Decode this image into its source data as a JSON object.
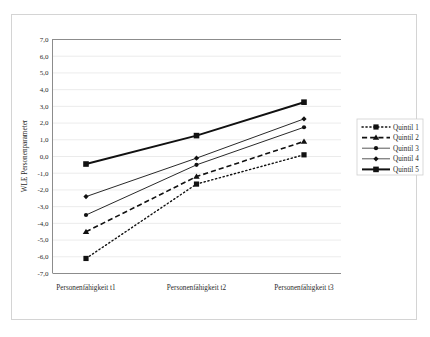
{
  "chart_data": {
    "type": "line",
    "title": "",
    "xlabel": "",
    "ylabel": "WLE Personenparameter",
    "categories": [
      "Personenfähigkeit t1",
      "Personenfähigkeit t2",
      "Personenfähigkeit t3"
    ],
    "ylim": [
      -7.0,
      7.0
    ],
    "ytick_step": 1.0,
    "ytick_labels": [
      "7,0",
      "6,0",
      "5,0",
      "4,0",
      "3,0",
      "2,0",
      "1,0",
      "0,0",
      "-1,0",
      "-2,0",
      "-3,0",
      "-4,0",
      "-5,0",
      "-6,0",
      "-7,0"
    ],
    "ytick_values": [
      7.0,
      6.0,
      5.0,
      4.0,
      3.0,
      2.0,
      1.0,
      0.0,
      -1.0,
      -2.0,
      -3.0,
      -4.0,
      -5.0,
      -6.0,
      -7.0
    ],
    "grid": true,
    "legend_position": "right",
    "series": [
      {
        "name": "Quintil 1",
        "values": [
          -6.1,
          -1.65,
          0.1
        ],
        "marker": "square",
        "linestyle": "dotted",
        "color": "#111111",
        "marker_size": 5.2,
        "line_width": 1.4
      },
      {
        "name": "Quintil 2",
        "values": [
          -4.5,
          -1.2,
          0.9
        ],
        "marker": "triangle",
        "linestyle": "dashed",
        "color": "#111111",
        "marker_size": 5.2,
        "line_width": 1.6
      },
      {
        "name": "Quintil 3",
        "values": [
          -3.5,
          -0.5,
          1.75
        ],
        "marker": "circle",
        "linestyle": "solid",
        "color": "#444444",
        "marker_size": 4.2,
        "line_width": 0.9
      },
      {
        "name": "Quintil 4",
        "values": [
          -2.4,
          -0.1,
          2.25
        ],
        "marker": "diamond",
        "linestyle": "solid",
        "color": "#444444",
        "marker_size": 4.2,
        "line_width": 0.9
      },
      {
        "name": "Quintil 5",
        "values": [
          -0.45,
          1.25,
          3.25
        ],
        "marker": "square",
        "linestyle": "solid",
        "color": "#111111",
        "marker_size": 5.6,
        "line_width": 2.0
      }
    ]
  },
  "legend": {
    "entries": [
      "Quintil 1",
      "Quintil 2",
      "Quintil 3",
      "Quintil 4",
      "Quintil 5"
    ]
  },
  "axis": {
    "y_title": "WLE Personenparameter"
  }
}
